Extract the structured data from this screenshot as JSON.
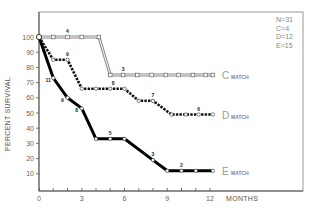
{
  "chart_data": {
    "type": "line",
    "title": "",
    "xlabel": "MONTHS",
    "ylabel": "PERCENT SURVIVAL",
    "xlim": [
      0,
      12
    ],
    "ylim": [
      0,
      100
    ],
    "x_ticks": [
      "0",
      "3",
      "6",
      "9",
      "12"
    ],
    "x_tick_values": [
      0,
      3,
      6,
      9,
      12
    ],
    "y_ticks": [
      "10",
      "20",
      "30",
      "40",
      "50",
      "60",
      "70",
      "80",
      "90",
      "100"
    ],
    "y_tick_values": [
      10,
      20,
      30,
      40,
      50,
      60,
      70,
      80,
      90,
      100
    ],
    "grid": false,
    "legend_position": "top-right",
    "legend": [
      "N=31",
      "C=4",
      "D=12",
      "E=15"
    ],
    "series": [
      {
        "name": "C MATCH",
        "letter": "C",
        "suffix": "MATCH",
        "style": "gray-double",
        "points": [
          {
            "x": 0,
            "y": 100
          },
          {
            "x": 1,
            "y": 100
          },
          {
            "x": 2,
            "y": 100
          },
          {
            "x": 3,
            "y": 100
          },
          {
            "x": 4.2,
            "y": 100
          },
          {
            "x": 5,
            "y": 75
          },
          {
            "x": 5.9,
            "y": 75
          },
          {
            "x": 6.9,
            "y": 75
          },
          {
            "x": 7.9,
            "y": 75
          },
          {
            "x": 8.9,
            "y": 75
          },
          {
            "x": 9.8,
            "y": 75
          },
          {
            "x": 10.8,
            "y": 75
          },
          {
            "x": 11.7,
            "y": 75
          },
          {
            "x": 12.2,
            "y": 75
          }
        ],
        "counts": [
          {
            "x": 2,
            "y": 100,
            "label": "4"
          },
          {
            "x": 5.9,
            "y": 75,
            "label": "3"
          }
        ]
      },
      {
        "name": "D MATCH",
        "letter": "D",
        "suffix": "MATCH",
        "style": "black-dashed",
        "points": [
          {
            "x": 0,
            "y": 100
          },
          {
            "x": 1,
            "y": 85
          },
          {
            "x": 2,
            "y": 85
          },
          {
            "x": 3,
            "y": 66
          },
          {
            "x": 4,
            "y": 66
          },
          {
            "x": 5,
            "y": 66
          },
          {
            "x": 6,
            "y": 66
          },
          {
            "x": 7,
            "y": 58
          },
          {
            "x": 8,
            "y": 58
          },
          {
            "x": 9.3,
            "y": 49
          },
          {
            "x": 10.3,
            "y": 49
          },
          {
            "x": 11.2,
            "y": 49
          },
          {
            "x": 12.2,
            "y": 49
          }
        ],
        "counts": [
          {
            "x": 2,
            "y": 85,
            "label": "9"
          },
          {
            "x": 5.2,
            "y": 66,
            "label": "8"
          },
          {
            "x": 8,
            "y": 58,
            "label": "7"
          },
          {
            "x": 11.2,
            "y": 49,
            "label": "6"
          }
        ]
      },
      {
        "name": "E MATCH",
        "letter": "E",
        "suffix": "MATCH",
        "style": "black-solid",
        "points": [
          {
            "x": 0,
            "y": 100
          },
          {
            "x": 1,
            "y": 73
          },
          {
            "x": 2,
            "y": 60
          },
          {
            "x": 3,
            "y": 53
          },
          {
            "x": 4,
            "y": 33
          },
          {
            "x": 5,
            "y": 33
          },
          {
            "x": 6,
            "y": 33
          },
          {
            "x": 8,
            "y": 19
          },
          {
            "x": 9,
            "y": 12
          },
          {
            "x": 10,
            "y": 12
          },
          {
            "x": 11,
            "y": 12
          },
          {
            "x": 12.2,
            "y": 12
          }
        ],
        "counts": [
          {
            "x": 1,
            "y": 73,
            "label": "11"
          },
          {
            "x": 2,
            "y": 60,
            "label": "9"
          },
          {
            "x": 3,
            "y": 53,
            "label": "8"
          },
          {
            "x": 5,
            "y": 33,
            "label": "5"
          },
          {
            "x": 8,
            "y": 19,
            "label": "3"
          },
          {
            "x": 10,
            "y": 12,
            "label": "2"
          }
        ]
      }
    ]
  }
}
